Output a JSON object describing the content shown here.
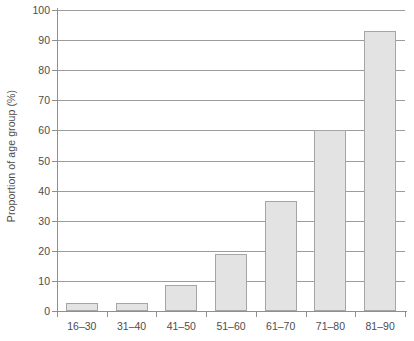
{
  "chart_data": {
    "type": "bar",
    "title": "",
    "subtitle": "",
    "xlabel": "",
    "ylabel": "Proportion of age group (%)",
    "categories": [
      "16–30",
      "31–40",
      "41–50",
      "51–60",
      "61–70",
      "71–80",
      "81–90"
    ],
    "values": [
      2.5,
      2.8,
      8.5,
      19,
      36.5,
      60,
      93
    ],
    "ylim": [
      0,
      100
    ],
    "y_ticks": [
      0,
      10,
      20,
      30,
      40,
      50,
      60,
      70,
      80,
      90,
      100
    ],
    "y_tick_labels": [
      "0",
      "10",
      "20",
      "30",
      "40",
      "50",
      "60",
      "70",
      "80",
      "90",
      "100"
    ],
    "grid": "horizontal",
    "legend": "none",
    "legend_position": "none",
    "annotations": []
  },
  "style": {
    "bar_fill": "#e3e3e3",
    "bar_border": "#a5a5a5",
    "gridline_color": "#9c9c9c",
    "axis_color": "#8f8f8f",
    "text_color": "#4d4d4d",
    "background": "#ffffff"
  }
}
